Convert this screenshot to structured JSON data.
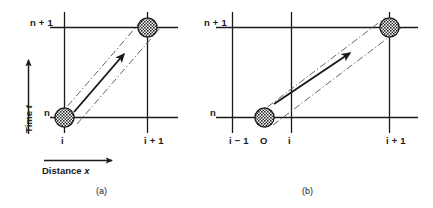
{
  "figure": {
    "type": "stencil-diagram",
    "width": 433,
    "height": 208,
    "background_color": "#ffffff",
    "line_color": "#1a1a1a"
  },
  "axes": {
    "time_axis": {
      "label_prefix": "Time ",
      "label_symbol": "t",
      "name": "time-axis",
      "direction": "up"
    },
    "distance_axis": {
      "label_prefix": "Distance ",
      "label_symbol": "x",
      "name": "distance-axis",
      "direction": "right"
    }
  },
  "panel_a": {
    "caption": "(a)",
    "time_labels": [
      {
        "id": "n-plus-1",
        "text": "n + 1"
      },
      {
        "id": "n",
        "text": "n"
      }
    ],
    "space_labels": [
      {
        "id": "i",
        "text": "i"
      },
      {
        "id": "i-plus-1",
        "text": "i + 1"
      }
    ],
    "nodes": [
      {
        "id": "node-start",
        "x_label": "i",
        "t_label": "n",
        "style": "hatched-circle"
      },
      {
        "id": "node-end",
        "x_label": "i + 1",
        "t_label": "n + 1",
        "style": "hatched-circle"
      }
    ],
    "arrow": {
      "id": "characteristic-arrow",
      "from": "i,n",
      "to": "i+1,n+1",
      "style": "solid-filled-head"
    },
    "characteristic_band": {
      "style": "dash-dot",
      "count": 2
    }
  },
  "panel_b": {
    "caption": "(b)",
    "time_labels": [
      {
        "id": "n-plus-1",
        "text": "n + 1"
      },
      {
        "id": "n",
        "text": "n"
      }
    ],
    "space_labels": [
      {
        "id": "i-minus-1",
        "text": "i − 1"
      },
      {
        "id": "origin",
        "text": "O"
      },
      {
        "id": "i",
        "text": "i"
      },
      {
        "id": "i-plus-1",
        "text": "i + 1"
      }
    ],
    "nodes": [
      {
        "id": "node-start",
        "x_label": "O",
        "t_label": "n",
        "style": "hatched-circle"
      },
      {
        "id": "node-end",
        "x_label": "i + 1",
        "t_label": "n + 1",
        "style": "hatched-circle"
      }
    ],
    "arrow": {
      "id": "characteristic-arrow",
      "from": "O,n",
      "to": "i+1,n+1",
      "style": "solid-filled-head"
    },
    "characteristic_band": {
      "style": "dash-dot",
      "count": 2
    }
  }
}
